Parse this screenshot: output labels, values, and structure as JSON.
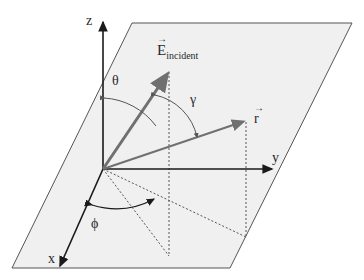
{
  "labels": {
    "z_axis": "z",
    "y_axis": "y",
    "x_axis": "x",
    "e_field": "E",
    "e_field_subscript": "incident",
    "r_vector": "r",
    "theta": "θ",
    "gamma": "γ",
    "phi": "ϕ"
  },
  "colors": {
    "plane_fill": "#f0f0f0",
    "plane_edge": "#555555",
    "axis": "#1a1a1a",
    "vector": "#707070",
    "dotted": "#555555"
  }
}
